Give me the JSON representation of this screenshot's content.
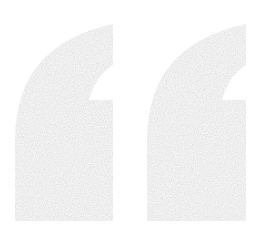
{
  "graphic": {
    "icon": "quotation-mark-icon",
    "glyph": "“",
    "fill_color": "#b4b4b4",
    "background_color": "#ffffff"
  }
}
